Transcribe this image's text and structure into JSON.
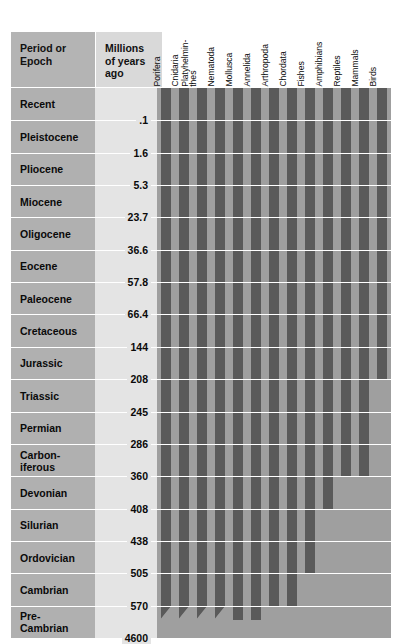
{
  "headers": {
    "period_label": "Period or\nEpoch",
    "mya_label": "Millions of\nyears ago"
  },
  "colors": {
    "bar": "#5a5a5a",
    "bar_field": "#9f9f9f",
    "period_cell": "#b0b0b0",
    "mya_field": "#e4e4e4",
    "header": "#b4b4b4",
    "gridline": "#ffffff"
  },
  "taxa": [
    "Porifera",
    "Cnidaria",
    "Platyhelmin-\nthes",
    "Nematoda",
    "Mollusca",
    "Annelida",
    "Arthropoda",
    "Chordata",
    "Fishes",
    "Amphibians",
    "Reptiles",
    "Mammals",
    "Birds"
  ],
  "periods": [
    "Recent",
    "Pleistocene",
    "Pliocene",
    "Miocene",
    "Oligocene",
    "Eocene",
    "Paleocene",
    "Cretaceous",
    "Jurassic",
    "Triassic",
    "Permian",
    "Carbon-\niferous",
    "Devonian",
    "Silurian",
    "Ordovician",
    "Cambrian",
    "Pre-\nCambrian"
  ],
  "boundaries": [
    ".1",
    "1.6",
    "5.3",
    "23.7",
    "36.6",
    "57.8",
    "66.4",
    "144",
    "208",
    "245",
    "286",
    "360",
    "408",
    "438",
    "505",
    "570",
    "4600"
  ],
  "chart_data": {
    "type": "bar",
    "xlabel": "",
    "ylabel": "Millions of years ago",
    "orientation": "vertical-ranges",
    "categories": [
      "Porifera",
      "Cnidaria",
      "Platyhelminthes",
      "Nematoda",
      "Mollusca",
      "Annelida",
      "Arthropoda",
      "Chordata",
      "Fishes",
      "Amphibians",
      "Reptiles",
      "Mammals",
      "Birds"
    ],
    "y_axis_boundaries_mya": [
      0.1,
      1.6,
      5.3,
      23.7,
      36.6,
      57.8,
      66.4,
      144,
      208,
      245,
      286,
      360,
      408,
      438,
      505,
      570,
      4600
    ],
    "epochs": [
      {
        "name": "Recent",
        "end_mya": 0.1
      },
      {
        "name": "Pleistocene",
        "end_mya": 1.6
      },
      {
        "name": "Pliocene",
        "end_mya": 5.3
      },
      {
        "name": "Miocene",
        "end_mya": 23.7
      },
      {
        "name": "Oligocene",
        "end_mya": 36.6
      },
      {
        "name": "Eocene",
        "end_mya": 57.8
      },
      {
        "name": "Paleocene",
        "end_mya": 66.4
      },
      {
        "name": "Cretaceous",
        "end_mya": 144
      },
      {
        "name": "Jurassic",
        "end_mya": 208
      },
      {
        "name": "Triassic",
        "end_mya": 245
      },
      {
        "name": "Permian",
        "end_mya": 286
      },
      {
        "name": "Carboniferous",
        "end_mya": 360
      },
      {
        "name": "Devonian",
        "end_mya": 408
      },
      {
        "name": "Silurian",
        "end_mya": 438
      },
      {
        "name": "Ordovician",
        "end_mya": 505
      },
      {
        "name": "Cambrian",
        "end_mya": 570
      },
      {
        "name": "Pre-Cambrian",
        "end_mya": 4600
      }
    ],
    "series": [
      {
        "name": "Porifera",
        "first_appearance_epoch": "Pre-Cambrian",
        "bar_end_row": 16,
        "tapered": true
      },
      {
        "name": "Cnidaria",
        "first_appearance_epoch": "Pre-Cambrian",
        "bar_end_row": 16,
        "tapered": true
      },
      {
        "name": "Platyhelminthes",
        "first_appearance_epoch": "Pre-Cambrian",
        "bar_end_row": 16,
        "tapered": true
      },
      {
        "name": "Nematoda",
        "first_appearance_epoch": "Pre-Cambrian",
        "bar_end_row": 16,
        "tapered": true
      },
      {
        "name": "Mollusca",
        "first_appearance_epoch": "Pre-Cambrian",
        "bar_end_row": 16,
        "tapered": false
      },
      {
        "name": "Annelida",
        "first_appearance_epoch": "Pre-Cambrian",
        "bar_end_row": 16,
        "tapered": false
      },
      {
        "name": "Arthropoda",
        "first_appearance_epoch": "Cambrian",
        "bar_end_row": 15,
        "tapered": false
      },
      {
        "name": "Chordata",
        "first_appearance_epoch": "Cambrian",
        "bar_end_row": 15,
        "tapered": false
      },
      {
        "name": "Fishes",
        "first_appearance_epoch": "Ordovician",
        "bar_end_row": 14,
        "tapered": false
      },
      {
        "name": "Amphibians",
        "first_appearance_epoch": "Devonian",
        "bar_end_row": 12,
        "tapered": false
      },
      {
        "name": "Reptiles",
        "first_appearance_epoch": "Carboniferous",
        "bar_end_row": 11,
        "tapered": false
      },
      {
        "name": "Mammals",
        "first_appearance_epoch": "Carboniferous",
        "bar_end_row": 11,
        "tapered": false
      },
      {
        "name": "Birds",
        "first_appearance_epoch": "Jurassic",
        "bar_end_row": 8,
        "tapered": false
      }
    ]
  }
}
